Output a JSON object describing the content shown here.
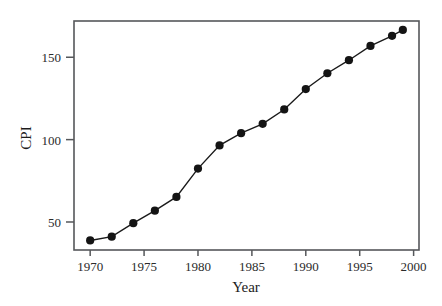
{
  "chart_data": {
    "type": "line",
    "title": "",
    "xlabel": "Year",
    "ylabel": "CPI",
    "xlim": [
      1968.5,
      2000.5
    ],
    "ylim": [
      33,
      172
    ],
    "grid": false,
    "legend": "none",
    "marker": "filled-circle",
    "line_color": "#1a1a1a",
    "frame_color": "#55575a",
    "xticks": [
      1970,
      1975,
      1980,
      1985,
      1990,
      1995,
      2000
    ],
    "xtick_labels": [
      "1970",
      "1975",
      "1980",
      "1985",
      "1990",
      "1995",
      "2000"
    ],
    "yticks": [
      50,
      100,
      150
    ],
    "ytick_labels": [
      "50",
      "100",
      "150"
    ],
    "x": [
      1970,
      1972,
      1974,
      1976,
      1978,
      1980,
      1982,
      1984,
      1986,
      1988,
      1990,
      1992,
      1994,
      1996,
      1998,
      1999
    ],
    "values": [
      38.8,
      41.1,
      49.3,
      56.9,
      65.2,
      82.4,
      96.5,
      103.9,
      109.6,
      118.3,
      130.7,
      140.3,
      148.2,
      156.9,
      163.0,
      166.6
    ],
    "series": [
      {
        "name": "CPI",
        "values": [
          38.8,
          41.1,
          49.3,
          56.9,
          65.2,
          82.4,
          96.5,
          103.9,
          109.6,
          118.3,
          130.7,
          140.3,
          148.2,
          156.9,
          163.0,
          166.6
        ]
      }
    ]
  },
  "axis": {
    "x_title": "Year",
    "y_title": "CPI"
  }
}
